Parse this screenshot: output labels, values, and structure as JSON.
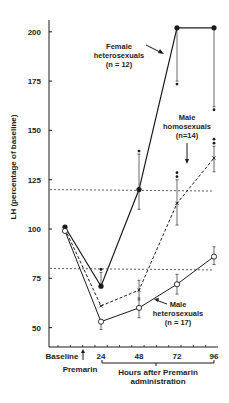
{
  "chart_data": {
    "type": "line",
    "title": "",
    "xlabel": "Hours after Premarin administration",
    "ylabel": "LH (percentage of baseline)",
    "x_categories": [
      "Baseline",
      "24",
      "48",
      "72",
      "96"
    ],
    "x_hours": [
      0,
      24,
      48,
      72,
      96
    ],
    "premarin_label": "Premarin",
    "y_ticks": [
      50,
      75,
      100,
      125,
      150,
      175,
      200
    ],
    "ylim": [
      40,
      210
    ],
    "reference_lines": [
      120,
      80
    ],
    "series": [
      {
        "name": "Female heterosexuals (n = 12)",
        "label_lines": [
          "Female",
          "heterosexuals",
          "(n = 12)"
        ],
        "style": "solid",
        "marker": "filled-circle",
        "values": [
          101,
          71,
          120,
          202,
          202
        ],
        "error_upper": [
          null,
          78,
          138,
          null,
          null
        ],
        "error_lower": [
          null,
          null,
          110,
          175,
          162
        ],
        "significance": [
          false,
          true,
          true,
          true,
          true
        ]
      },
      {
        "name": "Male homosexuals (n = 14)",
        "label_lines": [
          "Male",
          "homosexuals",
          "(n=14)"
        ],
        "style": "dashed",
        "marker": "cross",
        "values": [
          100,
          61,
          69,
          113,
          136
        ],
        "error_upper": [
          null,
          null,
          74,
          125,
          142
        ],
        "error_lower": [
          null,
          null,
          64,
          102,
          129
        ],
        "significance": [
          false,
          false,
          false,
          true,
          true
        ]
      },
      {
        "name": "Male heterosexuals (n = 17)",
        "label_lines": [
          "Male",
          "heterosexuals",
          "(n = 17)"
        ],
        "style": "solid",
        "marker": "open-circle",
        "values": [
          99,
          53,
          60,
          72,
          86
        ],
        "error_upper": [
          null,
          null,
          65,
          77,
          91
        ],
        "error_lower": [
          null,
          49,
          55,
          67,
          82
        ],
        "significance": [
          false,
          false,
          false,
          false,
          false
        ]
      }
    ]
  }
}
